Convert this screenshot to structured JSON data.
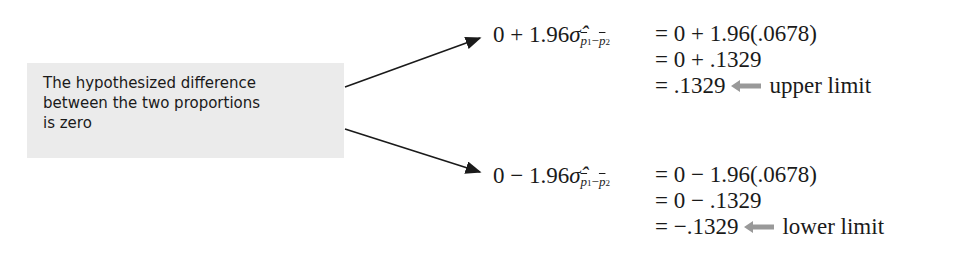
{
  "callout": {
    "lines": [
      "The hypothesized difference",
      "between the two proportions",
      "is zero"
    ]
  },
  "upper": {
    "lhs_prefix": "0 + 1.96",
    "sigma": "σ̂",
    "sub_p1": "p",
    "sub_1": "1",
    "sub_minus": "−",
    "sub_p2": "p",
    "sub_2": "2",
    "steps": [
      "= 0 + 1.96(.0678)",
      "= 0 + .1329",
      "= .1329"
    ],
    "label": "upper limit"
  },
  "lower": {
    "lhs_prefix": "0 − 1.96",
    "sigma": "σ̂",
    "sub_p1": "p",
    "sub_1": "1",
    "sub_minus": "−",
    "sub_p2": "p",
    "sub_2": "2",
    "steps": [
      "= 0 − 1.96(.0678)",
      "= 0 − .1329",
      "= −.1329"
    ],
    "label": "lower limit"
  },
  "colors": {
    "callout_bg": "#ebebeb",
    "arrow": "#1a1a1a",
    "label_arrow": "#999999"
  }
}
